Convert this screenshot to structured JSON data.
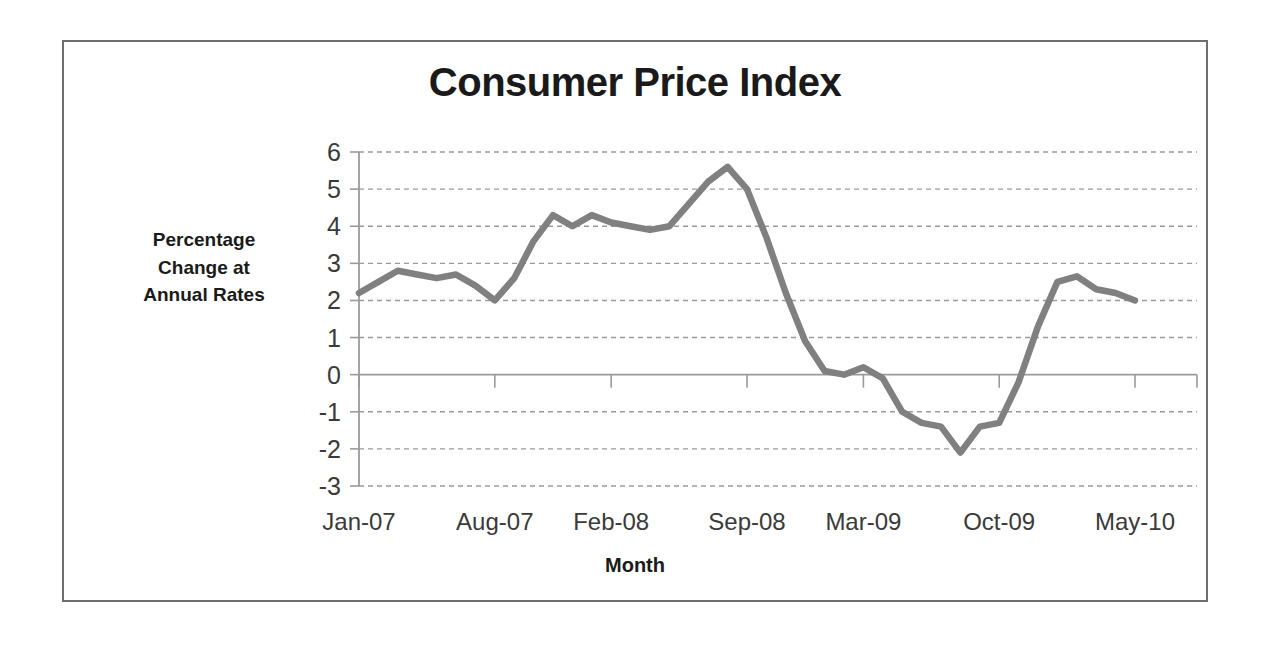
{
  "figure": {
    "title": "Consumer Price Index",
    "x_axis_title": "Month",
    "y_axis_title_lines": [
      "Percentage",
      "Change at",
      "Annual Rates"
    ],
    "y_axis_title": "Percentage Change at Annual Rates",
    "border_color": "#6e6e6e",
    "background_color": "#ffffff"
  },
  "chart_data": {
    "type": "line",
    "title": "Consumer Price Index",
    "xlabel": "Month",
    "ylabel": "Percentage Change at Annual Rates",
    "series_color": "#808080",
    "grid": true,
    "legend": "none",
    "ylim": [
      -3,
      6
    ],
    "ytick_labels": [
      "6",
      "5",
      "4",
      "3",
      "2",
      "1",
      "0",
      "-1",
      "-2",
      "-3"
    ],
    "yticks": [
      6,
      5,
      4,
      3,
      2,
      1,
      0,
      -1,
      -2,
      -3
    ],
    "xtick_labels": [
      "Jan-07",
      "Aug-07",
      "Feb-08",
      "Sep-08",
      "Mar-09",
      "Oct-09",
      "May-10"
    ],
    "xtick_indices": [
      0,
      7,
      13,
      20,
      26,
      33,
      40
    ],
    "x": [
      "Jan-07",
      "Feb-07",
      "Mar-07",
      "Apr-07",
      "May-07",
      "Jun-07",
      "Jul-07",
      "Aug-07",
      "Sep-07",
      "Oct-07",
      "Nov-07",
      "Dec-07",
      "Jan-08",
      "Feb-08",
      "Mar-08",
      "Apr-08",
      "May-08",
      "Jun-08",
      "Jul-08",
      "Aug-08",
      "Sep-08",
      "Oct-08",
      "Nov-08",
      "Dec-08",
      "Jan-09",
      "Feb-09",
      "Mar-09",
      "Apr-09",
      "May-09",
      "Jun-09",
      "Jul-09",
      "Aug-09",
      "Sep-09",
      "Oct-09",
      "Nov-09",
      "Dec-09",
      "Jan-10",
      "Feb-10",
      "Mar-10",
      "Apr-10",
      "May-10"
    ],
    "series": [
      {
        "name": "Percentage Change at Annual Rates",
        "values": [
          2.2,
          2.5,
          2.8,
          2.7,
          2.6,
          2.7,
          2.4,
          2.0,
          2.6,
          3.6,
          4.3,
          4.0,
          4.3,
          4.1,
          4.0,
          3.9,
          4.0,
          4.6,
          5.2,
          5.6,
          5.0,
          3.7,
          2.2,
          0.9,
          0.1,
          0.0,
          0.2,
          -0.1,
          -1.0,
          -1.3,
          -1.4,
          -2.1,
          -1.4,
          -1.3,
          -0.2,
          1.3,
          2.5,
          2.65,
          2.3,
          2.2,
          2.0
        ]
      }
    ]
  }
}
